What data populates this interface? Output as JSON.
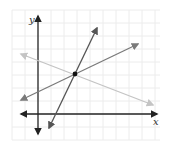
{
  "figure": {
    "type": "coordinate-plane",
    "axis_labels": {
      "x": "x",
      "y": "y"
    },
    "grid": {
      "visible": true,
      "color": "#ececec"
    },
    "point": {
      "label": "intersection",
      "color": "#111111"
    },
    "lines": [
      {
        "name": "steep-line",
        "color": "#555555",
        "description": "steep positive slope line through intersection"
      },
      {
        "name": "medium-line",
        "color": "#7a7a7a",
        "description": "gentle positive slope line through intersection"
      },
      {
        "name": "light-line",
        "color": "#c4c4c4",
        "description": "negative slope line through intersection"
      }
    ],
    "colors": {
      "axis": "#222222",
      "background": "#ffffff"
    }
  }
}
